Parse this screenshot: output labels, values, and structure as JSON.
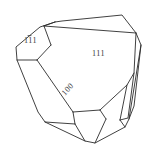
{
  "figure": {
    "kind": "crystal-morphology-drawing",
    "background_color": "#ffffff",
    "line_color": "#2b2b2b",
    "label_color": "#3a3a3a",
    "width": 156,
    "height": 154
  },
  "labels": {
    "face_111_bar": {
      "text": "111",
      "digits": [
        "1",
        "1",
        "1"
      ],
      "overbar_on_index": 1,
      "display": "11̅1",
      "x": 32,
      "y": 40
    },
    "face_111": {
      "text": "111",
      "x": 100,
      "y": 53
    },
    "face_100": {
      "text": "100",
      "x": 68,
      "y": 88,
      "rotation_deg": -48
    }
  },
  "outline": {
    "points": "55,22 40,27 16,47 17,60 38,112 45,122 85,141 95,143 125,127 129,119 141,45 136,33 122,15 62,21"
  },
  "faces": [
    {
      "name": "top-sliver-face",
      "points": "55,22 122,15 136,33 44,26"
    },
    {
      "name": "upper-left-face",
      "points": "44,26 55,22 40,27 16,47 17,60 37,60 51,45"
    },
    {
      "name": "large-111-face",
      "points": "44,26 136,33 134,73 127,85 100,110 73,112 51,45"
    },
    {
      "name": "right-sliver-face",
      "points": "136,33 141,45 134,106 129,119 128,118 134,73"
    },
    {
      "name": "right-lower-sliver",
      "points": "134,106 129,119 125,127 120,120 127,85"
    },
    {
      "name": "left-100-face",
      "points": "17,60 37,60 73,112 75,124 45,122 38,112"
    },
    {
      "name": "lower-center-face",
      "points": "73,112 100,110 106,119 95,143 85,141 75,124"
    },
    {
      "name": "lower-right-face",
      "points": "100,110 127,85 120,120 106,119"
    },
    {
      "name": "bottom-right-face",
      "points": "106,119 120,120 125,127 95,143"
    },
    {
      "name": "bottom-left-face",
      "points": "45,122 75,124 85,141"
    }
  ],
  "edges": [
    {
      "name": "outer-contour",
      "points": "55,22 40,27 16,47 17,60 38,112 45,122 85,141 95,143 125,127 129,119 141,45 136,33 122,15 62,21 55,22"
    },
    {
      "name": "top-sliver-lower-edge",
      "points": "44,26 136,33"
    },
    {
      "name": "top-sliver-left-edge",
      "points": "55,22 44,26"
    },
    {
      "name": "upper-left-inner-edge",
      "points": "44,26 51,45"
    },
    {
      "name": "upper-left-bottom-edge",
      "points": "17,60 37,60"
    },
    {
      "name": "upper-left-diagonal",
      "points": "37,60 51,45"
    },
    {
      "name": "face-100-long-edge",
      "points": "37,60 73,112"
    },
    {
      "name": "face-100-bottom-edge",
      "points": "45,122 75,124"
    },
    {
      "name": "face-100-right-edge",
      "points": "73,112 75,124"
    },
    {
      "name": "bottom-center-edge",
      "points": "75,124 85,141"
    },
    {
      "name": "lower-center-right-edge",
      "points": "73,112 100,110"
    },
    {
      "name": "lower-center-bottom-edge",
      "points": "100,110 106,119"
    },
    {
      "name": "bottom-right-inner-edge",
      "points": "106,119 95,143"
    },
    {
      "name": "lower-right-diagonal",
      "points": "100,110 127,85"
    },
    {
      "name": "right-sliver-inner-edge",
      "points": "136,33 134,73 128,118 120,120"
    },
    {
      "name": "right-sliver-mid-edge",
      "points": "134,73 127,85 120,120"
    },
    {
      "name": "right-lower-edge",
      "points": "120,120 125,127"
    },
    {
      "name": "right-sliver-outer-edge",
      "points": "141,45 134,106 129,119"
    }
  ]
}
